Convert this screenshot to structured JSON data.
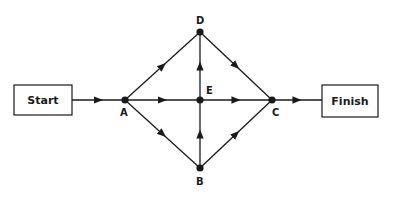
{
  "diagram": {
    "type": "network-flow",
    "start_label": "Start",
    "finish_label": "Finish",
    "nodes": [
      {
        "id": "A",
        "label": "A"
      },
      {
        "id": "B",
        "label": "B"
      },
      {
        "id": "C",
        "label": "C"
      },
      {
        "id": "D",
        "label": "D"
      },
      {
        "id": "E",
        "label": "E"
      }
    ],
    "edges": [
      {
        "from": "Start",
        "to": "A"
      },
      {
        "from": "A",
        "to": "D"
      },
      {
        "from": "A",
        "to": "E"
      },
      {
        "from": "A",
        "to": "B"
      },
      {
        "from": "E",
        "to": "D"
      },
      {
        "from": "B",
        "to": "E"
      },
      {
        "from": "E",
        "to": "C"
      },
      {
        "from": "D",
        "to": "C"
      },
      {
        "from": "B",
        "to": "C"
      },
      {
        "from": "C",
        "to": "Finish"
      }
    ],
    "line_color": "#1a1a1a"
  }
}
